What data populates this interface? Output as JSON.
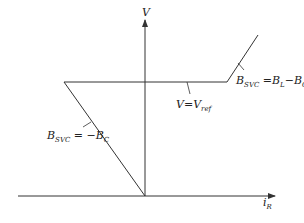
{
  "diagram": {
    "y_axis_label": "V",
    "x_axis_label_main": "i",
    "x_axis_label_sub": "R",
    "capacitive_label": {
      "main": "B",
      "sub": "SVC",
      "rest": " = −B",
      "rest_sub": "C"
    },
    "reference_label": {
      "main": "V=V",
      "sub": "ref"
    },
    "inductive_label": {
      "main": "B",
      "sub": "SVC",
      "rest1": " =B",
      "rest1_sub": "L",
      "rest2": "−B",
      "rest2_sub": "C"
    },
    "line_color": "#333333"
  }
}
